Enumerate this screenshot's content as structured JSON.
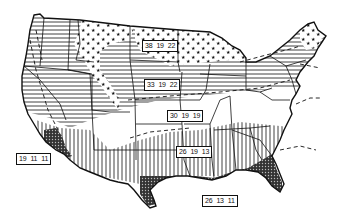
{
  "map": {
    "subject": "Continental United States climate zones",
    "style": "black-and-white line map with hatched/patterned zones",
    "colors": {
      "ink": "#111111",
      "background": "#ffffff"
    },
    "zone_patterns": [
      {
        "name": "stars",
        "description": "star pattern - northern tier / mountains"
      },
      {
        "name": "horizontal-lines",
        "description": "horizontal hatching - central/northern band"
      },
      {
        "name": "blank",
        "description": "white - middle band"
      },
      {
        "name": "vertical-lines",
        "description": "vertical hatching - southern band"
      },
      {
        "name": "dotted-dense",
        "description": "dense dotted pattern - Gulf coast / southern California"
      }
    ],
    "labels": [
      {
        "id": "zone-north",
        "values": [
          "38",
          "19",
          "22"
        ],
        "x": 142,
        "y": 40
      },
      {
        "id": "zone-north-central",
        "values": [
          "33",
          "19",
          "22"
        ],
        "x": 144,
        "y": 79
      },
      {
        "id": "zone-central",
        "values": [
          "30",
          "19",
          "19"
        ],
        "x": 167,
        "y": 110
      },
      {
        "id": "zone-south-central",
        "values": [
          "26",
          "19",
          "13"
        ],
        "x": 176,
        "y": 146
      },
      {
        "id": "zone-southwest-coast",
        "values": [
          "19",
          "11",
          "11"
        ],
        "x": 16,
        "y": 153
      },
      {
        "id": "zone-gulf",
        "values": [
          "26",
          "13",
          "11"
        ],
        "x": 202,
        "y": 195
      }
    ]
  }
}
